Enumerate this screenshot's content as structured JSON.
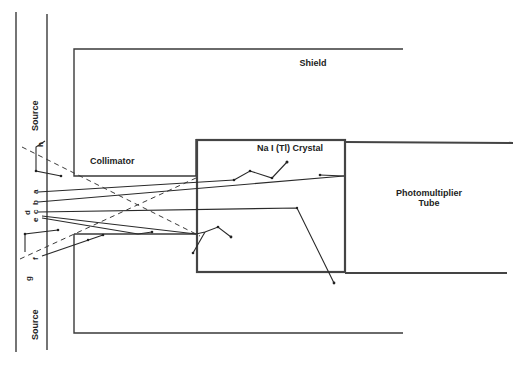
{
  "figure": {
    "title": "",
    "labels": {
      "shield": "Shield",
      "collimator": "Collimator",
      "crystal": "Na I (Tl)  Crystal",
      "photomultiplier_line1": "Photomultiplier",
      "photomultiplier_line2": "Tube",
      "source_top": "Source",
      "source_bottom": "Source"
    },
    "path_labels": {
      "a": "a",
      "b": "b",
      "c": "c",
      "d": "d",
      "e": "e",
      "f": "f",
      "g": "g",
      "h": "h"
    },
    "colors": {
      "line": "#3a3a3a",
      "background": "#ffffff"
    }
  }
}
